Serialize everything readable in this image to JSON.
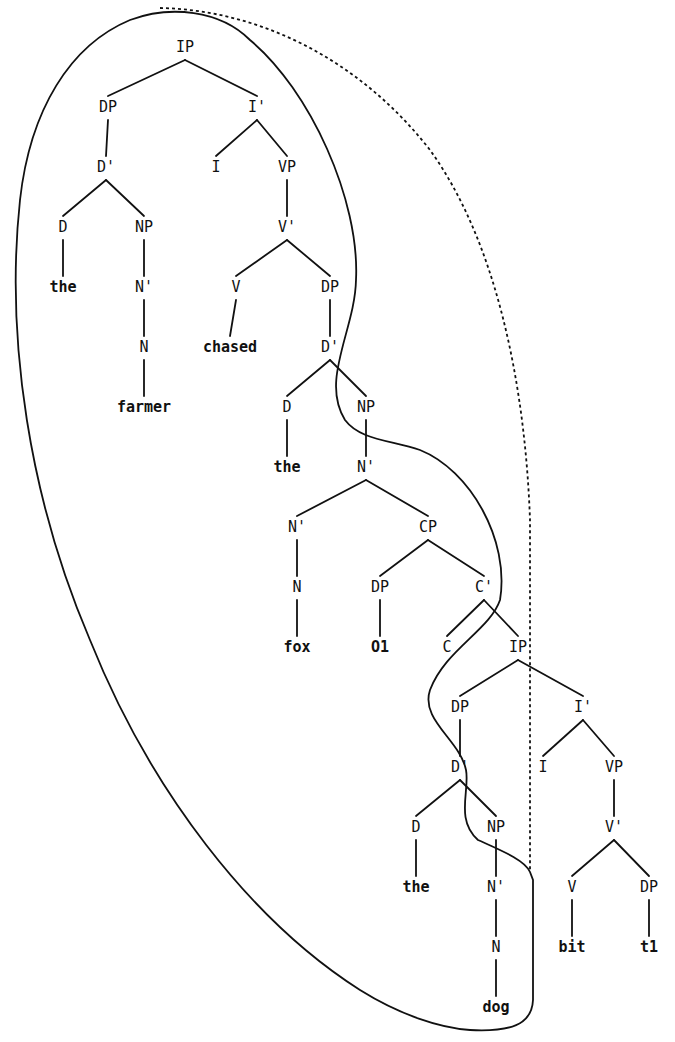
{
  "diagram": {
    "type": "syntax-tree",
    "sentence": "the farmer chased the fox O1 C the dog bit t1",
    "colors": {
      "ink": "#111111",
      "background": "#ffffff"
    },
    "nodes": [
      {
        "id": "ip1",
        "label": "IP",
        "x": 185,
        "y": 52,
        "kind": "cat"
      },
      {
        "id": "dp1",
        "label": "DP",
        "x": 108,
        "y": 112,
        "kind": "cat"
      },
      {
        "id": "ibar1",
        "label": "I'",
        "x": 257,
        "y": 112,
        "kind": "cat"
      },
      {
        "id": "dbar1",
        "label": "D'",
        "x": 106,
        "y": 172,
        "kind": "cat"
      },
      {
        "id": "i1",
        "label": "I",
        "x": 216,
        "y": 172,
        "kind": "cat"
      },
      {
        "id": "vp1",
        "label": "VP",
        "x": 287,
        "y": 172,
        "kind": "cat"
      },
      {
        "id": "d1",
        "label": "D",
        "x": 63,
        "y": 232,
        "kind": "cat"
      },
      {
        "id": "np1",
        "label": "NP",
        "x": 144,
        "y": 232,
        "kind": "cat"
      },
      {
        "id": "vbar1",
        "label": "V'",
        "x": 287,
        "y": 232,
        "kind": "cat"
      },
      {
        "id": "the1",
        "label": "the",
        "x": 63,
        "y": 292,
        "kind": "word"
      },
      {
        "id": "nbar1",
        "label": "N'",
        "x": 144,
        "y": 292,
        "kind": "cat"
      },
      {
        "id": "v1",
        "label": "V",
        "x": 236,
        "y": 292,
        "kind": "cat"
      },
      {
        "id": "dp2",
        "label": "DP",
        "x": 330,
        "y": 292,
        "kind": "cat"
      },
      {
        "id": "n1",
        "label": "N",
        "x": 144,
        "y": 352,
        "kind": "cat"
      },
      {
        "id": "chased",
        "label": "chased",
        "x": 230,
        "y": 352,
        "kind": "word"
      },
      {
        "id": "dbar2",
        "label": "D'",
        "x": 330,
        "y": 352,
        "kind": "cat"
      },
      {
        "id": "farmer",
        "label": "farmer",
        "x": 144,
        "y": 412,
        "kind": "word"
      },
      {
        "id": "d2",
        "label": "D",
        "x": 287,
        "y": 412,
        "kind": "cat"
      },
      {
        "id": "np2",
        "label": "NP",
        "x": 366,
        "y": 412,
        "kind": "cat"
      },
      {
        "id": "the2",
        "label": "the",
        "x": 287,
        "y": 472,
        "kind": "word"
      },
      {
        "id": "nbar2",
        "label": "N'",
        "x": 366,
        "y": 472,
        "kind": "cat"
      },
      {
        "id": "nbar3",
        "label": "N'",
        "x": 297,
        "y": 532,
        "kind": "cat"
      },
      {
        "id": "cp1",
        "label": "CP",
        "x": 428,
        "y": 532,
        "kind": "cat"
      },
      {
        "id": "n2",
        "label": "N",
        "x": 297,
        "y": 592,
        "kind": "cat"
      },
      {
        "id": "dp3",
        "label": "DP",
        "x": 380,
        "y": 592,
        "kind": "cat"
      },
      {
        "id": "cbar1",
        "label": "C'",
        "x": 484,
        "y": 592,
        "kind": "cat"
      },
      {
        "id": "fox",
        "label": "fox",
        "x": 297,
        "y": 652,
        "kind": "word"
      },
      {
        "id": "o1",
        "label": "O1",
        "x": 380,
        "y": 652,
        "kind": "word"
      },
      {
        "id": "c1",
        "label": "C",
        "x": 447,
        "y": 652,
        "kind": "cat"
      },
      {
        "id": "ip2",
        "label": "IP",
        "x": 518,
        "y": 652,
        "kind": "cat"
      },
      {
        "id": "dp4",
        "label": "DP",
        "x": 460,
        "y": 712,
        "kind": "cat"
      },
      {
        "id": "ibar2",
        "label": "I'",
        "x": 583,
        "y": 712,
        "kind": "cat"
      },
      {
        "id": "dbar3",
        "label": "D'",
        "x": 460,
        "y": 772,
        "kind": "cat"
      },
      {
        "id": "i2",
        "label": "I",
        "x": 543,
        "y": 772,
        "kind": "cat"
      },
      {
        "id": "vp2",
        "label": "VP",
        "x": 614,
        "y": 772,
        "kind": "cat"
      },
      {
        "id": "d3",
        "label": "D",
        "x": 416,
        "y": 832,
        "kind": "cat"
      },
      {
        "id": "np3",
        "label": "NP",
        "x": 496,
        "y": 832,
        "kind": "cat"
      },
      {
        "id": "vbar2",
        "label": "V'",
        "x": 614,
        "y": 832,
        "kind": "cat"
      },
      {
        "id": "the3",
        "label": "the",
        "x": 416,
        "y": 892,
        "kind": "word"
      },
      {
        "id": "nbar4",
        "label": "N'",
        "x": 496,
        "y": 892,
        "kind": "cat"
      },
      {
        "id": "v2",
        "label": "V",
        "x": 572,
        "y": 892,
        "kind": "cat"
      },
      {
        "id": "dp5",
        "label": "DP",
        "x": 649,
        "y": 892,
        "kind": "cat"
      },
      {
        "id": "n3",
        "label": "N",
        "x": 496,
        "y": 952,
        "kind": "cat"
      },
      {
        "id": "bit",
        "label": "bit",
        "x": 572,
        "y": 952,
        "kind": "word"
      },
      {
        "id": "t1",
        "label": "t1",
        "x": 649,
        "y": 952,
        "kind": "word"
      },
      {
        "id": "dog",
        "label": "dog",
        "x": 496,
        "y": 1012,
        "kind": "word"
      }
    ],
    "edges": [
      [
        "ip1",
        "dp1"
      ],
      [
        "ip1",
        "ibar1"
      ],
      [
        "dp1",
        "dbar1"
      ],
      [
        "ibar1",
        "i1"
      ],
      [
        "ibar1",
        "vp1"
      ],
      [
        "dbar1",
        "d1"
      ],
      [
        "dbar1",
        "np1"
      ],
      [
        "vp1",
        "vbar1"
      ],
      [
        "d1",
        "the1"
      ],
      [
        "np1",
        "nbar1"
      ],
      [
        "vbar1",
        "v1"
      ],
      [
        "vbar1",
        "dp2"
      ],
      [
        "nbar1",
        "n1"
      ],
      [
        "v1",
        "chased"
      ],
      [
        "dp2",
        "dbar2"
      ],
      [
        "n1",
        "farmer"
      ],
      [
        "dbar2",
        "d2"
      ],
      [
        "dbar2",
        "np2"
      ],
      [
        "d2",
        "the2"
      ],
      [
        "np2",
        "nbar2"
      ],
      [
        "nbar2",
        "nbar3"
      ],
      [
        "nbar2",
        "cp1"
      ],
      [
        "nbar3",
        "n2"
      ],
      [
        "cp1",
        "dp3"
      ],
      [
        "cp1",
        "cbar1"
      ],
      [
        "n2",
        "fox"
      ],
      [
        "dp3",
        "o1"
      ],
      [
        "cbar1",
        "c1"
      ],
      [
        "cbar1",
        "ip2"
      ],
      [
        "ip2",
        "dp4"
      ],
      [
        "ip2",
        "ibar2"
      ],
      [
        "dp4",
        "dbar3"
      ],
      [
        "ibar2",
        "i2"
      ],
      [
        "ibar2",
        "vp2"
      ],
      [
        "dbar3",
        "d3"
      ],
      [
        "dbar3",
        "np3"
      ],
      [
        "vp2",
        "vbar2"
      ],
      [
        "d3",
        "the3"
      ],
      [
        "np3",
        "nbar4"
      ],
      [
        "vbar2",
        "v2"
      ],
      [
        "vbar2",
        "dp5"
      ],
      [
        "nbar4",
        "n3"
      ],
      [
        "v2",
        "bit"
      ],
      [
        "dp5",
        "t1"
      ],
      [
        "n3",
        "dog"
      ]
    ],
    "regions": {
      "solid_outline": "M 530 872 C 525 860 500 850 478 840 C 455 820 470 790 466 770 C 460 740 420 720 430 690 C 445 650 490 630 500 600 C 510 540 470 470 420 450 C 390 440 360 440 345 420 C 320 380 355 330 356 280 C 360 200 310 90 250 40 C 220 10 170 5 130 20 C 70 45 30 110 20 200 C 5 340 30 500 90 640 C 150 790 250 920 360 990 C 400 1015 440 1028 470 1030 C 510 1032 532 1025 533 1000 L 533 880 Z",
      "dotted_outline": "M 160 8 C 260 10 360 60 430 150 C 495 240 525 380 530 520 L 530 872"
    }
  }
}
